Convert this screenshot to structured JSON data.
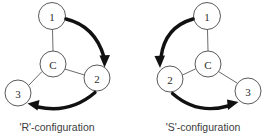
{
  "figure": {
    "background_color": "#ffffff",
    "line_color": "#6b6b6b",
    "arrow_color": "#111111",
    "label_color": "#2b2b2b"
  },
  "diagrams": [
    {
      "id": "r-configuration",
      "caption": "'R'-configuration",
      "direction": "clockwise",
      "center_node": {
        "label": "C",
        "cx": 53,
        "cy": 64,
        "r": 13
      },
      "nodes": [
        {
          "label": "1",
          "cx": 52,
          "cy": 16,
          "r": 13.5
        },
        {
          "label": "2",
          "cx": 97,
          "cy": 78,
          "r": 13
        },
        {
          "label": "3",
          "cx": 18,
          "cy": 93,
          "r": 13
        }
      ],
      "arrows": [
        {
          "from": "1",
          "to": "2",
          "label": "one-to-two"
        },
        {
          "from": "2",
          "to": "3",
          "label": "two-to-three"
        }
      ]
    },
    {
      "id": "s-configuration",
      "caption": "'S'-configuration",
      "direction": "counter-clockwise",
      "center_node": {
        "label": "C",
        "cx": 208,
        "cy": 64,
        "r": 13
      },
      "nodes": [
        {
          "label": "1",
          "cx": 207,
          "cy": 16,
          "r": 13.5
        },
        {
          "label": "2",
          "cx": 170,
          "cy": 79,
          "r": 13
        },
        {
          "label": "3",
          "cx": 248,
          "cy": 91,
          "r": 13
        }
      ],
      "arrows": [
        {
          "from": "1",
          "to": "2",
          "label": "one-to-two"
        },
        {
          "from": "2",
          "to": "3",
          "label": "two-to-three"
        }
      ]
    }
  ],
  "captions": {
    "left": "'R'-configuration",
    "right": "'S'-configuration"
  }
}
